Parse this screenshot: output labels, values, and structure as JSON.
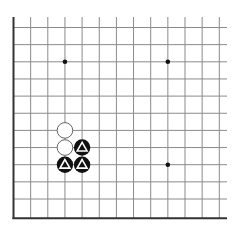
{
  "board": {
    "type": "go-board-fragment",
    "visible_columns": 13,
    "visible_rows": 12,
    "edges": [
      "left",
      "bottom"
    ],
    "colors": {
      "background": "#ffffff",
      "grid_line": "#8a8a8a",
      "border_line": "#333333",
      "black_stone": "#111111",
      "white_stone": "#ffffff",
      "marker": "#ffffff"
    },
    "star_points": [
      {
        "col": 3,
        "row": 2
      },
      {
        "col": 9,
        "row": 2
      },
      {
        "col": 9,
        "row": 8
      }
    ],
    "stones": [
      {
        "color": "white",
        "col": 3,
        "row": 6,
        "marker": "none"
      },
      {
        "color": "white",
        "col": 3,
        "row": 7,
        "marker": "none"
      },
      {
        "color": "black",
        "col": 4,
        "row": 7,
        "marker": "triangle"
      },
      {
        "color": "black",
        "col": 3,
        "row": 8,
        "marker": "triangle"
      },
      {
        "color": "black",
        "col": 4,
        "row": 8,
        "marker": "triangle"
      }
    ]
  }
}
